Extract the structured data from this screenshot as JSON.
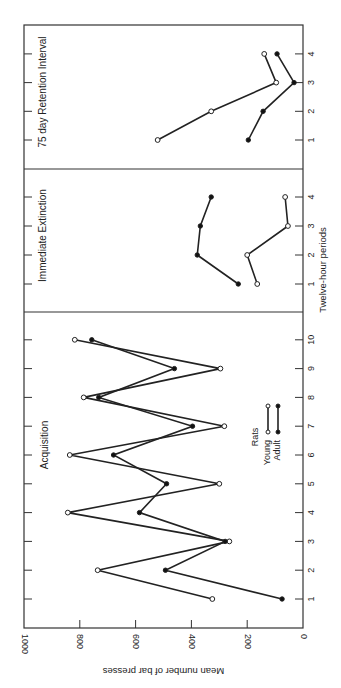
{
  "chart_data": {
    "type": "line",
    "orientation": "figure rotated 90 degrees counter-clockwise",
    "ylabel": "Mean number of bar presses",
    "xlabel": "Twelve-hour periods",
    "ylim": [
      0,
      1000
    ],
    "yticks": [
      "0",
      "200",
      "400",
      "600",
      "800",
      "1000"
    ],
    "legend": {
      "title": "Rats",
      "entries": [
        {
          "name": "Young",
          "marker": "open-circle"
        },
        {
          "name": "Adult",
          "marker": "filled-circle"
        }
      ]
    },
    "panels": [
      {
        "title": "Acquisition",
        "x": [
          1,
          2,
          3,
          4,
          5,
          6,
          7,
          8,
          9,
          10
        ],
        "xticks": [
          "1",
          "2",
          "3",
          "4",
          "5",
          "6",
          "7",
          "8",
          "9",
          "10"
        ],
        "series": [
          {
            "name": "Young",
            "values": [
              325,
              736,
              264,
              843,
              300,
              836,
              282,
              786,
              296,
              818
            ]
          },
          {
            "name": "Adult",
            "values": [
              75,
              493,
              279,
              586,
              489,
              679,
              396,
              732,
              461,
              757
            ]
          }
        ]
      },
      {
        "title": "Immediate Extinction",
        "x": [
          1,
          2,
          3,
          4
        ],
        "xticks": [
          "1",
          "2",
          "3",
          "4"
        ],
        "series": [
          {
            "name": "Young",
            "values": [
              164,
              200,
              54,
              64
            ]
          },
          {
            "name": "Adult",
            "values": [
              232,
              379,
              368,
              329
            ]
          }
        ]
      },
      {
        "title": "75 day Retention Interval",
        "x": [
          1,
          2,
          3,
          4
        ],
        "xticks": [
          "1",
          "2",
          "3",
          "4"
        ],
        "series": [
          {
            "name": "Young",
            "values": [
              521,
              329,
              96,
              139
            ]
          },
          {
            "name": "Adult",
            "values": [
              196,
              143,
              32,
              93
            ]
          }
        ]
      }
    ]
  }
}
